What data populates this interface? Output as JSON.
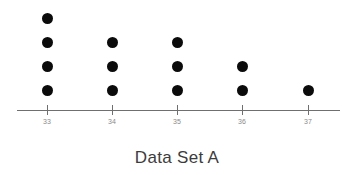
{
  "chart_data": {
    "type": "scatter",
    "plot_style": "dot-plot",
    "title": "Data Set A",
    "xlabel": "",
    "ylabel": "",
    "categories": [
      "33",
      "34",
      "35",
      "36",
      "37"
    ],
    "values": [
      4,
      3,
      3,
      2,
      1
    ],
    "x": [
      33,
      34,
      35,
      36,
      37
    ],
    "counts": [
      4,
      3,
      3,
      2,
      1
    ],
    "tick_labels": [
      "33",
      "34",
      "35",
      "36",
      "37"
    ],
    "xlim": [
      32.55,
      37.5
    ],
    "ylim": [
      0,
      5
    ],
    "grid": false,
    "legend": false,
    "legend_position": "none",
    "total_observations": 13,
    "dot_color": "#0b0b0b",
    "axis_color": "#6f6f6f",
    "tick_label_color": "#8a8a8a",
    "title_color": "#3c3c3c",
    "background_color": "#ffffff"
  },
  "axis": {
    "line_start_x": 17,
    "line_end_x": 340,
    "line_y": 110,
    "tick_positions_px": [
      47,
      112,
      177,
      242,
      308
    ]
  },
  "dot_layout": {
    "diameter_px": 11,
    "row_spacing_px": 24,
    "baseline_y_px": 90
  }
}
